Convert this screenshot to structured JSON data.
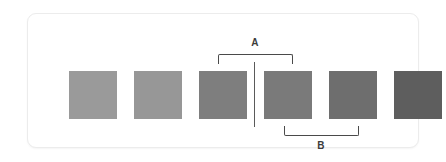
{
  "diagram": {
    "card": {
      "background_color": "#ffffff",
      "border_color": "#ececec"
    },
    "swatches": [
      {
        "index": 1,
        "label": "",
        "color": "#9a9a9a",
        "x": 0
      },
      {
        "index": 2,
        "label": "",
        "color": "#979797",
        "x": 65
      },
      {
        "index": 3,
        "label": "",
        "color": "#7e7e7e",
        "x": 130
      },
      {
        "index": 4,
        "label": "",
        "color": "#7a7a7a",
        "x": 195
      },
      {
        "index": 5,
        "label": "",
        "color": "#6e6e6e",
        "x": 260
      },
      {
        "index": 6,
        "label": "",
        "color": "#5e5e5e",
        "x": 325
      }
    ],
    "divider": {
      "name": "vertical-divider",
      "color": "#5a5a5a",
      "between_swatches": "3-4"
    },
    "brackets": [
      {
        "id": "A",
        "label": "A",
        "position": "top",
        "spans_swatches": "3-4",
        "color": "#4a4a4a"
      },
      {
        "id": "B",
        "label": "B",
        "position": "bottom",
        "spans_swatches": "4-5",
        "color": "#4a4a4a"
      }
    ]
  }
}
